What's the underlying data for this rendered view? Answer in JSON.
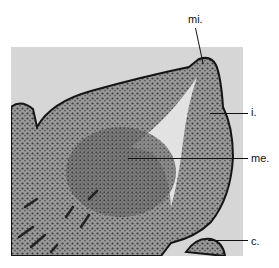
{
  "figure": {
    "labels": [
      {
        "id": "mi",
        "text": "mi."
      },
      {
        "id": "i",
        "text": "i."
      },
      {
        "id": "me",
        "text": "me."
      },
      {
        "id": "c",
        "text": "c."
      }
    ],
    "colors": {
      "background": "#ffffff",
      "photo_background": "#d6d6d6",
      "tissue": "#8a8a8a",
      "tissue_dark": "#3a3a3a",
      "border": "#151515"
    }
  }
}
